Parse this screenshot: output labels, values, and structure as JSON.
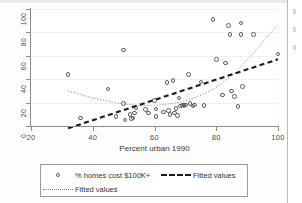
{
  "chart_data": {
    "type": "scatter",
    "title": "",
    "xlabel": "Percent urban 1990",
    "ylabel": "",
    "xlim": [
      20,
      100
    ],
    "ylim": [
      0,
      100
    ],
    "xticks": [
      20,
      40,
      60,
      80,
      100
    ],
    "yticks": [
      0,
      20,
      40,
      60,
      80,
      100
    ],
    "grid": true,
    "legend_position": "below-plot",
    "series": [
      {
        "name": "% homes cost $100K+",
        "type": "scatter",
        "marker": "open-circle",
        "points": [
          [
            32,
            44
          ],
          [
            36,
            7
          ],
          [
            45,
            31.5
          ],
          [
            47.5,
            8
          ],
          [
            50,
            65
          ],
          [
            50,
            19
          ],
          [
            50.5,
            5
          ],
          [
            52,
            10
          ],
          [
            52.5,
            6.5
          ],
          [
            53,
            7
          ],
          [
            53.5,
            11
          ],
          [
            54,
            15.5
          ],
          [
            57,
            14
          ],
          [
            58,
            11
          ],
          [
            60,
            22
          ],
          [
            60.5,
            14.5
          ],
          [
            60.5,
            8
          ],
          [
            63,
            12
          ],
          [
            64,
            37
          ],
          [
            64.5,
            13
          ],
          [
            65,
            10
          ],
          [
            66,
            39
          ],
          [
            66.5,
            11
          ],
          [
            67,
            15
          ],
          [
            67.5,
            9
          ],
          [
            68,
            24
          ],
          [
            68.5,
            17
          ],
          [
            69,
            18
          ],
          [
            69.5,
            17.5
          ],
          [
            70,
            18
          ],
          [
            71,
            44
          ],
          [
            71.5,
            19
          ],
          [
            72.5,
            17
          ],
          [
            73,
            18
          ],
          [
            75,
            37.5
          ],
          [
            76,
            17.5
          ],
          [
            79,
            91
          ],
          [
            80,
            57
          ],
          [
            82,
            26.5
          ],
          [
            83,
            54
          ],
          [
            84,
            86
          ],
          [
            84.5,
            78
          ],
          [
            85,
            30
          ],
          [
            86,
            25
          ],
          [
            87,
            16.5
          ],
          [
            88,
            88
          ],
          [
            88,
            78
          ],
          [
            88.5,
            34
          ],
          [
            92,
            78
          ],
          [
            100,
            61.5
          ]
        ]
      },
      {
        "name": "Fitted values",
        "type": "line",
        "style": "dashed",
        "color": "#1a1a1a",
        "points": [
          [
            32,
            -2
          ],
          [
            100,
            57
          ]
        ]
      },
      {
        "name": "Fitted values",
        "type": "line",
        "style": "dotted",
        "color": "#7d7d7d",
        "points": [
          [
            32,
            30
          ],
          [
            40,
            24
          ],
          [
            48,
            19.5
          ],
          [
            55,
            17.5
          ],
          [
            62,
            18
          ],
          [
            68,
            20
          ],
          [
            74,
            25
          ],
          [
            80,
            33
          ],
          [
            86,
            45
          ],
          [
            92,
            62
          ],
          [
            97,
            78
          ],
          [
            100,
            86
          ]
        ]
      }
    ]
  },
  "axes": {
    "y_tick_labels": [
      "0",
      "20",
      "40",
      "60",
      "80",
      "100"
    ],
    "x_tick_labels": [
      "20",
      "40",
      "60",
      "80",
      "100"
    ],
    "x_axis_title": "Percent urban 1990"
  },
  "legend": {
    "entries": [
      {
        "key": "open-circle-marker",
        "label": "% homes cost $100K+"
      },
      {
        "key": "dashed-line",
        "label": "Fitted values"
      },
      {
        "key": "dotted-line",
        "label": "Fitted values"
      }
    ]
  },
  "colors": {
    "marker_stroke": "#5d5d5d",
    "dashed_fit": "#1a1a1a",
    "dotted_fit": "#7d7d7d",
    "axis": "#8d8d8d",
    "grid": "#f0f0f0",
    "background": "#ffffff"
  }
}
